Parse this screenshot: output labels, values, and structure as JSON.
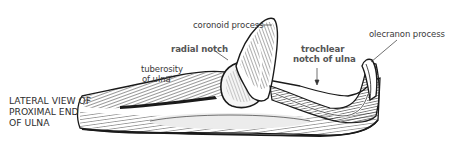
{
  "figure": {
    "caption_lines": [
      "LATERAL VIEW OF",
      "PROXIMAL END",
      "OF ULNA"
    ],
    "labels": {
      "coronoid_process": "coronoid process",
      "radial_notch": "radial notch",
      "tuberosity_line1": "tuberosity",
      "tuberosity_line2": "of ulna",
      "trochlear_line1": "trochlear",
      "trochlear_line2": "notch of ulna",
      "olecranon_process": "olecranon process"
    },
    "colors": {
      "ink": "#1a1a1a",
      "label_text": "#3a3a3a",
      "bold_label_text": "#555555",
      "background": "#ffffff",
      "bone_light": "#e9e9e9"
    }
  }
}
